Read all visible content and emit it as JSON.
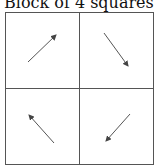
{
  "title": "Block of 4 squares",
  "squares": [
    {
      "position": "top-left",
      "arrow": "up-right"
    },
    {
      "position": "top-right",
      "arrow": "down-right"
    },
    {
      "position": "bottom-left",
      "arrow": "up-left"
    },
    {
      "position": "bottom-right",
      "arrow": "down-left"
    }
  ],
  "colors": {
    "border": "#555555",
    "arrow": "#555555"
  }
}
